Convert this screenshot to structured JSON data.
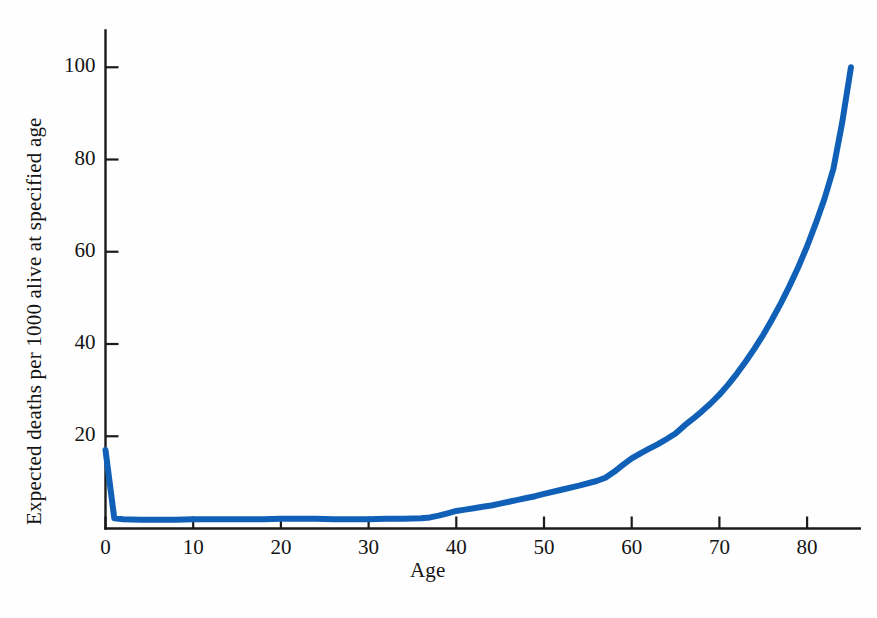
{
  "chart_data": {
    "type": "line",
    "title": "",
    "subtitle": "",
    "xlabel": "Age",
    "ylabel": "Expected deaths per 1000 alive at specified age",
    "xlim": [
      0,
      86
    ],
    "ylim": [
      0,
      108
    ],
    "grid": false,
    "legend": null,
    "x_ticks": [
      0,
      10,
      20,
      30,
      40,
      50,
      60,
      70,
      80
    ],
    "x_tick_labels": [
      "0",
      "10",
      "20",
      "30",
      "40",
      "50",
      "60",
      "70",
      "80"
    ],
    "y_ticks": [
      20,
      40,
      60,
      80,
      100
    ],
    "y_tick_labels": [
      "20",
      "40",
      "60",
      "80",
      "100"
    ],
    "line_color": "#1060b8",
    "axis_color": "#1a1a1a",
    "line_width": 6,
    "series": [
      {
        "name": "Expected deaths per 1000",
        "color": "#1060b8",
        "x": [
          0,
          1,
          2,
          4,
          6,
          8,
          10,
          12,
          14,
          16,
          18,
          20,
          22,
          24,
          26,
          28,
          30,
          32,
          34,
          36,
          37,
          38,
          39,
          40,
          41,
          42,
          43,
          44,
          45,
          46,
          47,
          48,
          49,
          50,
          52,
          54,
          56,
          57,
          58,
          59,
          60,
          61,
          62,
          63,
          64,
          65,
          66,
          67,
          68,
          69,
          70,
          71,
          72,
          73,
          74,
          75,
          76,
          77,
          78,
          79,
          80,
          81,
          82,
          83,
          84,
          85
        ],
        "y": [
          17.0,
          2.2,
          2.0,
          1.9,
          1.9,
          1.9,
          2.0,
          2.0,
          2.0,
          2.0,
          2.0,
          2.1,
          2.1,
          2.1,
          2.0,
          2.0,
          2.0,
          2.1,
          2.1,
          2.2,
          2.4,
          2.8,
          3.3,
          3.8,
          4.1,
          4.4,
          4.7,
          5.0,
          5.4,
          5.8,
          6.2,
          6.6,
          7.0,
          7.5,
          8.4,
          9.3,
          10.3,
          11.0,
          12.3,
          13.8,
          15.2,
          16.3,
          17.3,
          18.3,
          19.4,
          20.6,
          22.3,
          23.8,
          25.4,
          27.1,
          29.0,
          31.2,
          33.6,
          36.2,
          39.0,
          42.0,
          45.3,
          48.8,
          52.6,
          56.7,
          61.2,
          66.2,
          71.6,
          78.0,
          88.0,
          100.0
        ]
      }
    ]
  },
  "axes": {
    "x_axis_name": "age-axis",
    "y_axis_name": "deaths-axis"
  }
}
